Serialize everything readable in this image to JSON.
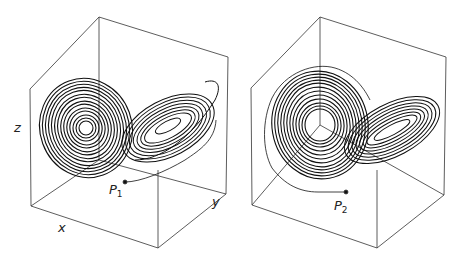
{
  "figure": {
    "panels": [
      {
        "id": "left",
        "axis_labels": {
          "x": "x",
          "y": "y",
          "z": "z"
        },
        "point_label": "P",
        "point_subscript": "1"
      },
      {
        "id": "right",
        "point_label": "P",
        "point_subscript": "2"
      }
    ],
    "colors": {
      "line": "#222222",
      "background": "#ffffff"
    }
  }
}
